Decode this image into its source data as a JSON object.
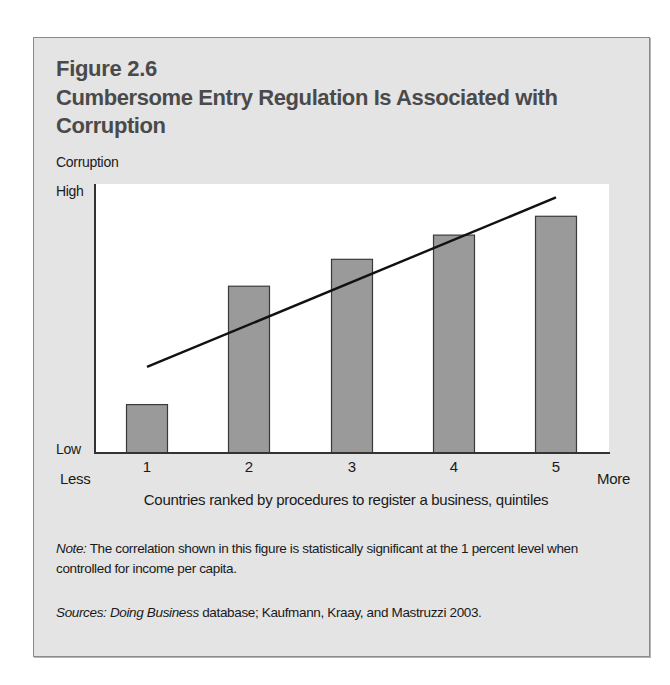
{
  "figure": {
    "number": "Figure 2.6",
    "title": "Cumbersome Entry Regulation Is Associated with Corruption",
    "y_title": "Corruption",
    "y_high": "High",
    "y_low": "Low",
    "x_less": "Less",
    "x_more": "More",
    "x_title": "Countries ranked by procedures to register a business, quintiles",
    "note_label": "Note:",
    "note_text": " The correlation shown in this figure is statistically significant at the 1 percent level when controlled for income per capita.",
    "sources_label": "Sources: ",
    "sources_italic": "Doing Business",
    "sources_text": " database; Kaufmann, Kraay, and Mastruzzi 2003."
  },
  "colors": {
    "background": "#e4e4e4",
    "bar_fill": "#9a9a9a",
    "bar_stroke": "#3a3a3a",
    "trend_line": "#111111",
    "title": "#4a4a4a"
  },
  "chart_data": {
    "type": "bar",
    "title": "Cumbersome Entry Regulation Is Associated with Corruption",
    "xlabel": "Countries ranked by procedures to register a business, quintiles",
    "ylabel": "Corruption",
    "categories": [
      "1",
      "2",
      "3",
      "4",
      "5"
    ],
    "values": [
      18,
      62,
      72,
      81,
      88
    ],
    "ylim": [
      0,
      100
    ],
    "y_tick_labels": [
      "Low",
      "High"
    ],
    "x_end_labels": [
      "Less",
      "More"
    ],
    "grid": false,
    "legend": null,
    "trend_line": {
      "x_start": 1,
      "y_start": 32,
      "x_end": 5,
      "y_end": 95
    },
    "annotations": [
      "Note: The correlation shown in this figure is statistically significant at the 1 percent level when controlled for income per capita.",
      "Sources: Doing Business database; Kaufmann, Kraay, and Mastruzzi 2003."
    ]
  }
}
